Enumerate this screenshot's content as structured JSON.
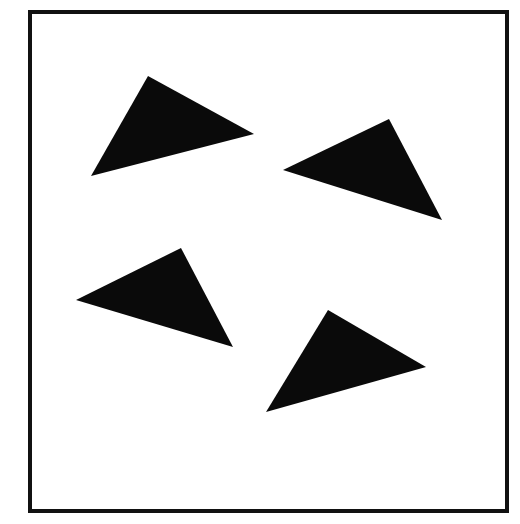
{
  "figure": {
    "canvas": {
      "width": 520,
      "height": 524,
      "background_color": "#ffffff"
    },
    "frame": {
      "name": "border-rectangle",
      "x": 30,
      "y": 12,
      "width": 477,
      "height": 499,
      "stroke_color": "#111111",
      "stroke_width": 4,
      "fill_color": "#ffffff"
    },
    "shape_color": "#0a0a0a",
    "shape_count": 4,
    "shapes": [
      {
        "id": "triangle-1",
        "label": "upper-left-triangle",
        "type": "triangle",
        "fill": "#0a0a0a",
        "points": "148,76 254,134 91,176",
        "vertices": [
          [
            148,
            76
          ],
          [
            254,
            134
          ],
          [
            91,
            176
          ]
        ],
        "centroid": [
          164,
          129
        ],
        "orientation": "apex-up-pointing-right"
      },
      {
        "id": "triangle-2",
        "label": "upper-right-triangle",
        "type": "triangle",
        "fill": "#0a0a0a",
        "points": "389,119 442,220 283,170",
        "vertices": [
          [
            389,
            119
          ],
          [
            442,
            220
          ],
          [
            283,
            170
          ]
        ],
        "centroid": [
          371,
          170
        ],
        "orientation": "apex-up-pointing-left"
      },
      {
        "id": "triangle-3",
        "label": "lower-left-triangle",
        "type": "triangle",
        "fill": "#0a0a0a",
        "points": "181,248 233,347 76,300",
        "vertices": [
          [
            181,
            248
          ],
          [
            233,
            347
          ],
          [
            76,
            300
          ]
        ],
        "centroid": [
          163,
          298
        ],
        "orientation": "apex-up-pointing-left"
      },
      {
        "id": "triangle-4",
        "label": "lower-right-triangle",
        "type": "triangle",
        "fill": "#0a0a0a",
        "points": "328,310 426,367 266,412",
        "vertices": [
          [
            328,
            310
          ],
          [
            426,
            367
          ],
          [
            266,
            412
          ]
        ],
        "centroid": [
          340,
          363
        ],
        "orientation": "apex-up-pointing-right"
      }
    ]
  }
}
